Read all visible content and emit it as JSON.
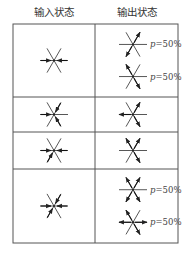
{
  "headers": {
    "input": "输入状态",
    "output": "输出状态"
  },
  "rows": [
    {
      "input": {
        "arrows": [
          {
            "dir": "W",
            "sense": "in"
          },
          {
            "dir": "E",
            "sense": "in"
          }
        ]
      },
      "outputs": [
        {
          "arrows": [
            {
              "dir": "NE",
              "sense": "out"
            },
            {
              "dir": "SW",
              "sense": "out"
            }
          ],
          "prob": "p=50%"
        },
        {
          "arrows": [
            {
              "dir": "NW",
              "sense": "out"
            },
            {
              "dir": "SE",
              "sense": "out"
            }
          ],
          "prob": "p=50%"
        }
      ]
    },
    {
      "input": {
        "arrows": [
          {
            "dir": "W",
            "sense": "in"
          },
          {
            "dir": "NE",
            "sense": "in"
          },
          {
            "dir": "SE",
            "sense": "in"
          }
        ]
      },
      "outputs": [
        {
          "arrows": [
            {
              "dir": "W",
              "sense": "out"
            },
            {
              "dir": "NE",
              "sense": "out"
            },
            {
              "dir": "SE",
              "sense": "out"
            }
          ],
          "prob": ""
        }
      ]
    },
    {
      "input": {
        "arrows": [
          {
            "dir": "W",
            "sense": "in"
          },
          {
            "dir": "E",
            "sense": "in"
          },
          {
            "dir": "SW",
            "sense": "in"
          }
        ]
      },
      "outputs": [
        {
          "arrows": [
            {
              "dir": "NW",
              "sense": "out"
            },
            {
              "dir": "NE",
              "sense": "out"
            },
            {
              "dir": "SE",
              "sense": "out"
            }
          ],
          "prob": ""
        }
      ]
    },
    {
      "input": {
        "arrows": [
          {
            "dir": "W",
            "sense": "in"
          },
          {
            "dir": "E",
            "sense": "in"
          },
          {
            "dir": "NE",
            "sense": "in"
          },
          {
            "dir": "SW",
            "sense": "in"
          }
        ]
      },
      "outputs": [
        {
          "arrows": [
            {
              "dir": "NW",
              "sense": "out"
            },
            {
              "dir": "NE",
              "sense": "out"
            },
            {
              "dir": "SW",
              "sense": "out"
            },
            {
              "dir": "SE",
              "sense": "out"
            }
          ],
          "prob": "p=50%"
        },
        {
          "arrows": [
            {
              "dir": "W",
              "sense": "out"
            },
            {
              "dir": "E",
              "sense": "out"
            },
            {
              "dir": "NW",
              "sense": "out"
            },
            {
              "dir": "SE",
              "sense": "out"
            }
          ],
          "prob": "p=50%"
        }
      ]
    }
  ]
}
